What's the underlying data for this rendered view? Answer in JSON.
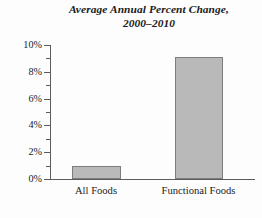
{
  "chart_data": {
    "type": "bar",
    "title": "Average Annual Percent Change, 2000–2010",
    "title_line1": "Average Annual Percent Change,",
    "title_line2": "2000–2010",
    "categories": [
      "All Foods",
      "Functional Foods"
    ],
    "values": [
      1.0,
      9.1
    ],
    "xlabel": "",
    "ylabel": "",
    "ylim": [
      0,
      10
    ],
    "y_tick_values": [
      0,
      2,
      4,
      6,
      8,
      10
    ],
    "y_tick_labels": [
      "0%",
      "2%",
      "4%",
      "6%",
      "8%",
      "10%"
    ],
    "y_minor_ticks": [
      1,
      3,
      5,
      7,
      9
    ],
    "grid": false,
    "legend": null,
    "series": [
      {
        "name": "Average Annual Percent Change",
        "values": [
          1.0,
          9.1
        ]
      }
    ],
    "colors": {
      "bar_fill": "#b9b9b9",
      "bar_border": "#7d7d7d",
      "axis": "#5c5c5c",
      "text": "#1a1a1a",
      "background": "#ffffff"
    }
  }
}
